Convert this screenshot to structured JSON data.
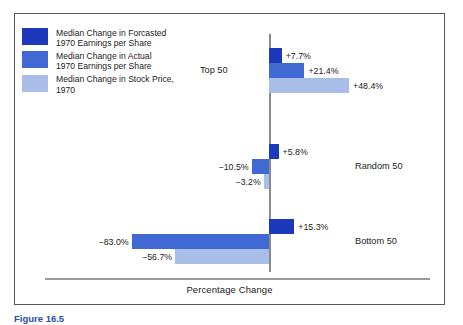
{
  "figure": {
    "caption": "Figure 16.5"
  },
  "legend": {
    "items": [
      {
        "label": "Median Change in Forcasted\n1970 Earnings per Share",
        "color": "#1c39bb",
        "name": "forecasted-eps"
      },
      {
        "label": "Median Change in Actual\n1970 Earnings per Share",
        "color": "#4169d4",
        "name": "actual-eps"
      },
      {
        "label": "Median Change in Stock Price,\n1970",
        "color": "#a8bee8",
        "name": "stock-price"
      }
    ]
  },
  "chart_data": {
    "type": "bar",
    "orientation": "horizontal",
    "title": "",
    "xlabel": "Percentage Change",
    "ylabel": "",
    "grid": false,
    "legend_position": "top-left",
    "zero_line": true,
    "categories": [
      "Top 50",
      "Random 50",
      "Bottom 50"
    ],
    "series": [
      {
        "name": "Median Change in Forcasted 1970 Earnings per Share",
        "color": "#1c39bb",
        "values": [
          7.7,
          5.8,
          15.3
        ],
        "labels": [
          "+7.7%",
          "+5.8%",
          "+15.3%"
        ]
      },
      {
        "name": "Median Change in Actual 1970 Earnings per Share",
        "color": "#4169d4",
        "values": [
          21.4,
          -10.5,
          -83.0
        ],
        "labels": [
          "+21.4%",
          "−10.5%",
          "−83.0%"
        ]
      },
      {
        "name": "Median Change in Stock Price, 1970",
        "color": "#a8bee8",
        "values": [
          48.4,
          -3.2,
          -56.7
        ],
        "labels": [
          "+48.4%",
          "−3.2%",
          "−56.7%"
        ]
      }
    ],
    "xlim": [
      -90,
      55
    ]
  },
  "groups": [
    {
      "label": "Top 50",
      "label_side": "left",
      "bars": [
        {
          "value_text": "+7.7%",
          "series": 0
        },
        {
          "value_text": "+21.4%",
          "series": 1
        },
        {
          "value_text": "+48.4%",
          "series": 2
        }
      ]
    },
    {
      "label": "Random 50",
      "label_side": "right",
      "bars": [
        {
          "value_text": "+5.8%",
          "series": 0
        },
        {
          "value_text": "−10.5%",
          "series": 1
        },
        {
          "value_text": "−3.2%",
          "series": 2
        }
      ]
    },
    {
      "label": "Bottom 50",
      "label_side": "right",
      "bars": [
        {
          "value_text": "+15.3%",
          "series": 0
        },
        {
          "value_text": "−83.0%",
          "series": 1
        },
        {
          "value_text": "−56.7%",
          "series": 2
        }
      ]
    }
  ]
}
